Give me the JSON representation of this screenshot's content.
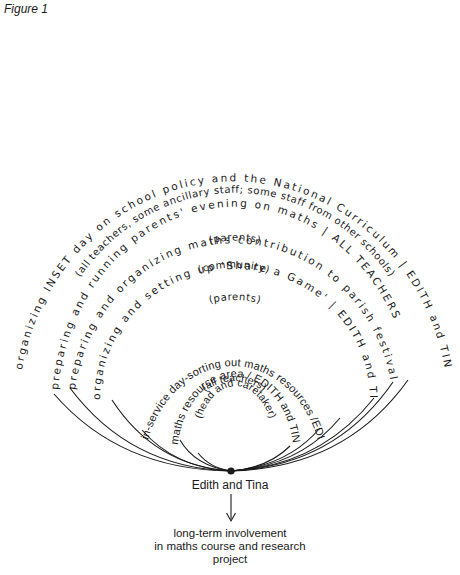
{
  "figure": {
    "label": "Figure 1",
    "focus": "Edith and Tina",
    "outcome_lines": [
      "long-term involvement",
      "in maths course and research",
      "project"
    ]
  },
  "arcs": [
    {
      "activity": "organizing INSET day on school policy and the National Curriculum | EDITH and TINA",
      "audience": "(all teachers, some ancillary staff; some staff from other schools)"
    },
    {
      "activity": "preparing and running parents' evening on maths | ALL TEACHERS",
      "audience": "(parents)"
    },
    {
      "activity": "preparing and organizing maths contribution to parish festival | ALL TEACHERS",
      "audience": "(community)"
    },
    {
      "activity": "organizing and setting up 'Share a Game' | EDITH and TINA",
      "audience": "(parents)"
    },
    {
      "activity": "in-service day-sorting out maths resources /EDITH TINA and HEAD",
      "audience": "(all teachers)"
    },
    {
      "activity": "maths resource area / EDITH and TINA",
      "audience": "(head and caretaker)"
    }
  ],
  "colors": {
    "ink": "#1a1a1a",
    "paper": "#ffffff"
  }
}
